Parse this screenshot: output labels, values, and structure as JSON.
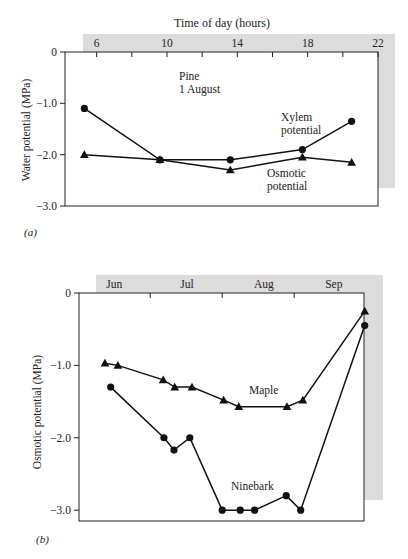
{
  "chart_data": [
    {
      "id": "a",
      "panel_label": "(a)",
      "type": "line",
      "title": "Pine 1 August",
      "title_lines": [
        "Pine",
        "1 August"
      ],
      "xlabel": "Time of day (hours)",
      "ylabel": "Water potential (MPa)",
      "xlim": [
        4.2,
        22
      ],
      "ylim": [
        -3.0,
        0
      ],
      "xticks": [
        6,
        10,
        14,
        18,
        22
      ],
      "xminor": [
        8,
        12,
        16,
        20
      ],
      "yticks": [
        0,
        -1.0,
        -2.0,
        -3.0
      ],
      "ytick_labels": [
        "0",
        "−1.0",
        "−2.0",
        "−3.0"
      ],
      "series": [
        {
          "name": "Xylem potential",
          "label_lines": [
            "Xylem",
            "potential"
          ],
          "marker": "circle",
          "x": [
            5.3,
            9.6,
            13.6,
            17.7,
            20.5
          ],
          "values": [
            -1.1,
            -2.1,
            -2.1,
            -1.9,
            -1.35
          ]
        },
        {
          "name": "Osmotic potential",
          "label_lines": [
            "Osmotic",
            "potential"
          ],
          "marker": "triangle",
          "x": [
            5.3,
            9.6,
            13.6,
            17.7,
            20.5
          ],
          "values": [
            -2.0,
            -2.1,
            -2.3,
            -2.05,
            -2.15
          ]
        }
      ]
    },
    {
      "id": "b",
      "panel_label": "(b)",
      "type": "line",
      "title": "",
      "xlabel": "",
      "ylabel": "Osmotic potential (MPa)",
      "xlim": [
        0,
        3.96
      ],
      "ylim": [
        -3.15,
        0
      ],
      "xtick_labels": [
        "Jun",
        "Jul",
        "Aug",
        "Sep"
      ],
      "xtick_label_pos": [
        0.49,
        1.5,
        2.57,
        3.54
      ],
      "xminor": [
        0.99,
        1.99,
        2.99
      ],
      "yticks": [
        0,
        -1.0,
        -2.0,
        -3.0
      ],
      "ytick_labels": [
        "0",
        "−1.0",
        "−2.0",
        "−3.0"
      ],
      "series": [
        {
          "name": "Maple",
          "marker": "triangle",
          "x": [
            0.36,
            0.54,
            1.17,
            1.33,
            1.57,
            2.01,
            2.22,
            2.89,
            3.11,
            3.97
          ],
          "values": [
            -0.97,
            -1.0,
            -1.2,
            -1.3,
            -1.3,
            -1.48,
            -1.57,
            -1.57,
            -1.48,
            -0.25
          ]
        },
        {
          "name": "Ninebark",
          "marker": "circle",
          "x": [
            0.44,
            1.18,
            1.32,
            1.54,
            1.99,
            2.24,
            2.44,
            2.88,
            3.08,
            3.97
          ],
          "values": [
            -1.3,
            -2.0,
            -2.17,
            -2.0,
            -3.0,
            -3.0,
            -3.0,
            -2.8,
            -3.0,
            -0.45
          ]
        }
      ]
    }
  ]
}
